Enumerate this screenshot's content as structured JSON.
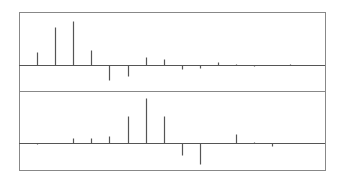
{
  "chart_data": [
    {
      "type": "bar",
      "subtype": "stem",
      "panel": "top",
      "title": "",
      "xlabel": "",
      "ylabel": "",
      "grid": false,
      "legend": null,
      "x": [
        0,
        1,
        2,
        3,
        4,
        5,
        6,
        7,
        8,
        9,
        10,
        11,
        12,
        13,
        14,
        15
      ],
      "values": [
        13,
        38,
        44,
        15,
        -15,
        -11,
        8,
        6,
        -4,
        -3,
        3,
        1,
        -1,
        0,
        1,
        0
      ],
      "ylim": [
        -26,
        53
      ]
    },
    {
      "type": "bar",
      "subtype": "stem",
      "panel": "bottom",
      "title": "",
      "xlabel": "",
      "ylabel": "",
      "grid": false,
      "legend": null,
      "x": [
        0,
        1,
        2,
        3,
        4,
        5,
        6,
        7,
        8,
        9,
        10,
        11,
        12,
        13,
        14,
        15
      ],
      "values": [
        -1,
        0,
        5,
        5,
        7,
        27,
        45,
        27,
        -12,
        -21,
        0,
        9,
        1,
        -3,
        0,
        0
      ],
      "ylim": [
        -27,
        52
      ]
    }
  ],
  "layout": {
    "frame": {
      "left": 19,
      "right": 325,
      "top": 12,
      "divider": 91,
      "bottom": 170
    },
    "zero_lines": [
      65,
      143
    ],
    "x_start": 37,
    "x_step": 18.1,
    "colors": {
      "stem": "#555555",
      "frame": "#888888",
      "axis": "#555555"
    }
  }
}
